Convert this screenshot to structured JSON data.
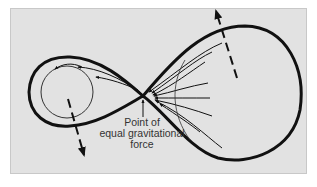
{
  "figure": {
    "label": {
      "line1": "Point of",
      "line2": "equal gravitational",
      "line3": "force"
    },
    "elements": [
      {
        "name": "figure-eight-roche-lobes",
        "description": "Thick closed figure-eight curve (equipotential surface)"
      },
      {
        "name": "small-star",
        "description": "Thin circle inside the left lobe"
      },
      {
        "name": "mass-transfer-streams",
        "description": "Arrowed streamlines from the right lobe converging on the crossing point and flowing around the small star"
      },
      {
        "name": "rotation-axis-dashed-right",
        "description": "Dashed arrow at top of right lobe pointing up-left"
      },
      {
        "name": "rotation-axis-dashed-left",
        "description": "Dashed arrow in left lobe pointing down"
      },
      {
        "name": "crossing-point-pointer",
        "description": "Vertical arrow from label to the crossing point"
      }
    ],
    "colors": {
      "background": "#e2e2e2",
      "stroke": "#111111",
      "text": "#333333"
    }
  }
}
